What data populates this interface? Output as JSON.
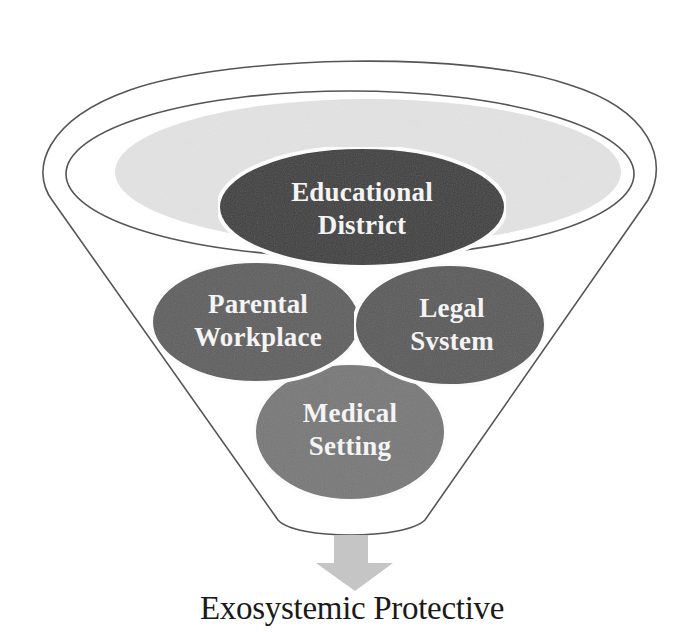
{
  "diagram": {
    "type": "funnel",
    "colors": {
      "background": "#ffffff",
      "outline": "#555555",
      "top_band": "#e3e3e3",
      "arrow": "#c6c6c6",
      "label_text": "#f4f4f4",
      "caption_text": "#1a1a1a"
    },
    "nodes": [
      {
        "id": "educational-district",
        "line1": "Educational",
        "line2": "District",
        "color": "#3c3c3c"
      },
      {
        "id": "parental-workplace",
        "line1": "Parental",
        "line2": "Workplace",
        "color": "#5f5f5f"
      },
      {
        "id": "legal-system",
        "line1": "Legal",
        "line2": "Svstem",
        "color": "#5a5a5a"
      },
      {
        "id": "medical-setting",
        "line1": "Medical",
        "line2": "Setting",
        "color": "#787878"
      }
    ],
    "output_arrow": "down-arrow-icon",
    "caption": "Exosystemic Protective"
  }
}
